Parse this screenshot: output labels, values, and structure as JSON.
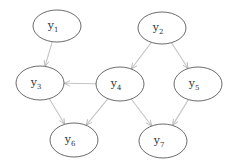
{
  "diagram": {
    "type": "directed-graph",
    "nodes": [
      {
        "id": "y1",
        "base": "y",
        "sub": "1",
        "cx": 57,
        "cy": 26,
        "rx": 24,
        "ry": 16
      },
      {
        "id": "y2",
        "base": "y",
        "sub": "2",
        "cx": 162,
        "cy": 28,
        "rx": 24,
        "ry": 16
      },
      {
        "id": "y3",
        "base": "y",
        "sub": "3",
        "cx": 40,
        "cy": 83,
        "rx": 24,
        "ry": 17
      },
      {
        "id": "y4",
        "base": "y",
        "sub": "4",
        "cx": 120,
        "cy": 84,
        "rx": 24,
        "ry": 17
      },
      {
        "id": "y5",
        "base": "y",
        "sub": "5",
        "cx": 198,
        "cy": 84,
        "rx": 24,
        "ry": 17
      },
      {
        "id": "y6",
        "base": "y",
        "sub": "6",
        "cx": 74,
        "cy": 140,
        "rx": 24,
        "ry": 17
      },
      {
        "id": "y7",
        "base": "y",
        "sub": "7",
        "cx": 163,
        "cy": 141,
        "rx": 24,
        "ry": 17
      }
    ],
    "edges": [
      {
        "from": "y1",
        "to": "y3"
      },
      {
        "from": "y2",
        "to": "y4"
      },
      {
        "from": "y2",
        "to": "y5"
      },
      {
        "from": "y4",
        "to": "y3"
      },
      {
        "from": "y3",
        "to": "y6"
      },
      {
        "from": "y4",
        "to": "y6"
      },
      {
        "from": "y4",
        "to": "y7"
      },
      {
        "from": "y5",
        "to": "y7"
      }
    ],
    "colors": {
      "node_stroke": "#5a5a5a",
      "edge_stroke": "#c4c4c4",
      "label": "#333333",
      "background": "#ffffff"
    }
  }
}
